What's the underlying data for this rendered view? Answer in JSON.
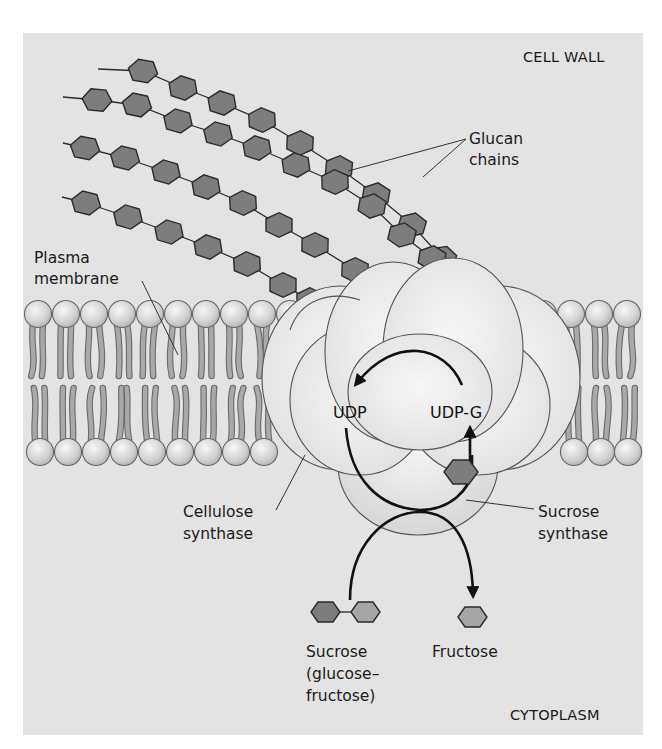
{
  "figure": {
    "regions": {
      "top": "CELL WALL",
      "bottom": "CYTOPLASM"
    },
    "labels": {
      "glucan_line1": "Glucan",
      "glucan_line2": "chains",
      "plasma_line1": "Plasma",
      "plasma_line2": "membrane",
      "cellulose_line1": "Cellulose",
      "cellulose_line2": "synthase",
      "sucrose_synthase_line1": "Sucrose",
      "sucrose_synthase_line2": "synthase",
      "udp": "UDP",
      "udpg": "UDP-G",
      "sucrose_line1": "Sucrose",
      "sucrose_line2": "(glucose–",
      "sucrose_line3": "fructose)",
      "fructose": "Fructose"
    },
    "colors": {
      "panel_bg": "#e3e3e3",
      "glucose_hex": "#7d7d7d",
      "fructose_hex": "#a6a6a6",
      "enzyme": "#ececec",
      "lipid_head": "#d4d4d4"
    }
  }
}
